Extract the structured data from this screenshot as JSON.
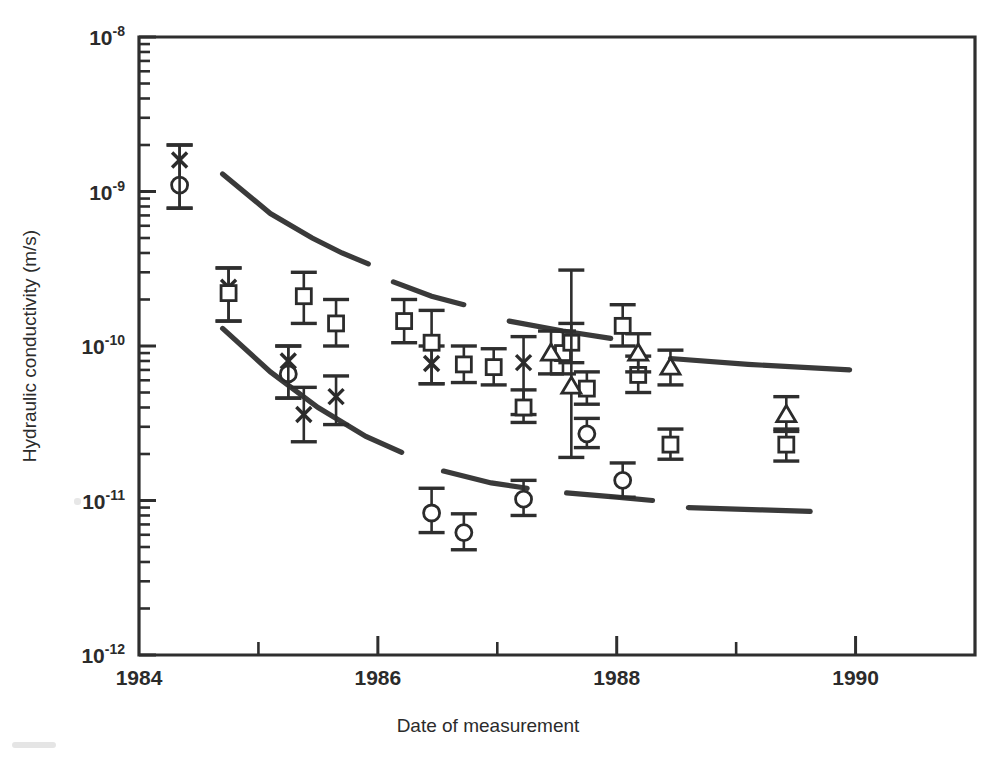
{
  "chart_data": {
    "type": "scatter",
    "title": "",
    "xlabel": "Date of measurement",
    "ylabel": "Hydraulic conductivity (m/s)",
    "xlim": [
      1984,
      1991
    ],
    "ylim": [
      1e-12,
      1e-08
    ],
    "yscale": "log",
    "xscale": "linear",
    "grid": false,
    "legend": "none",
    "x_tick_labels": [
      "1984",
      "1986",
      "1988",
      "1990"
    ],
    "x_tick_values": [
      1984,
      1986,
      1988,
      1990
    ],
    "x_minor_tick_values": [
      1985,
      1987,
      1989,
      1991
    ],
    "y_tick_labels": [
      "10-12",
      "10-11",
      "10-10",
      "10-9",
      "10-8"
    ],
    "y_tick_mantissas": [
      "10",
      "10",
      "10",
      "10",
      "10"
    ],
    "y_tick_exponents": [
      "-12",
      "-11",
      "-10",
      "-9",
      "-8"
    ],
    "y_tick_values": [
      1e-12,
      1e-11,
      1e-10,
      1e-09,
      1e-08
    ],
    "series": [
      {
        "name": "circle-series",
        "marker": "circle",
        "points": [
          {
            "x": 1984.34,
            "y": 1.1e-09,
            "yerr_low": 7.8e-10,
            "yerr_high": 2e-09
          },
          {
            "x": 1985.25,
            "y": 6.6e-11,
            "yerr_low": 4.6e-11,
            "yerr_high": 1e-10
          },
          {
            "x": 1986.45,
            "y": 8.3e-12,
            "yerr_low": 6.2e-12,
            "yerr_high": 1.2e-11
          },
          {
            "x": 1986.72,
            "y": 6.2e-12,
            "yerr_low": 4.8e-12,
            "yerr_high": 8.2e-12
          },
          {
            "x": 1987.22,
            "y": 1.02e-11,
            "yerr_low": 8e-12,
            "yerr_high": 1.35e-11
          },
          {
            "x": 1987.75,
            "y": 2.7e-11,
            "yerr_low": 2.2e-11,
            "yerr_high": 3.4e-11
          },
          {
            "x": 1988.05,
            "y": 1.35e-11,
            "yerr_low": 1.05e-11,
            "yerr_high": 1.75e-11
          }
        ]
      },
      {
        "name": "cross-series",
        "marker": "cross",
        "points": [
          {
            "x": 1984.34,
            "y": 1.6e-09,
            "yerr_low": 7.8e-10,
            "yerr_high": 2e-09
          },
          {
            "x": 1984.75,
            "y": 2.4e-10,
            "yerr_low": 1.45e-10,
            "yerr_high": 3.2e-10
          },
          {
            "x": 1985.25,
            "y": 8e-11,
            "yerr_low": 4.6e-11,
            "yerr_high": 1e-10
          },
          {
            "x": 1985.38,
            "y": 3.6e-11,
            "yerr_low": 2.4e-11,
            "yerr_high": 5.4e-11
          },
          {
            "x": 1985.65,
            "y": 4.7e-11,
            "yerr_low": 3.1e-11,
            "yerr_high": 6.4e-11
          },
          {
            "x": 1986.45,
            "y": 7.7e-11,
            "yerr_low": 5.7e-11,
            "yerr_high": 1e-10
          },
          {
            "x": 1987.22,
            "y": 7.8e-11,
            "yerr_low": 3.6e-11,
            "yerr_high": 1.15e-10
          }
        ]
      },
      {
        "name": "square-series",
        "marker": "square",
        "points": [
          {
            "x": 1984.75,
            "y": 2.2e-10,
            "yerr_low": 1.45e-10,
            "yerr_high": 3.2e-10
          },
          {
            "x": 1985.38,
            "y": 2.1e-10,
            "yerr_low": 1.4e-10,
            "yerr_high": 3e-10
          },
          {
            "x": 1985.65,
            "y": 1.4e-10,
            "yerr_low": 1e-10,
            "yerr_high": 2e-10
          },
          {
            "x": 1986.22,
            "y": 1.45e-10,
            "yerr_low": 1.05e-10,
            "yerr_high": 2e-10
          },
          {
            "x": 1986.45,
            "y": 1.05e-10,
            "yerr_low": 5.7e-11,
            "yerr_high": 1.7e-10
          },
          {
            "x": 1986.72,
            "y": 7.6e-11,
            "yerr_low": 5.8e-11,
            "yerr_high": 1e-10
          },
          {
            "x": 1986.97,
            "y": 7.3e-11,
            "yerr_low": 5.6e-11,
            "yerr_high": 9.6e-11
          },
          {
            "x": 1987.22,
            "y": 4e-11,
            "yerr_low": 3.2e-11,
            "yerr_high": 5.2e-11
          },
          {
            "x": 1987.55,
            "y": 9e-11,
            "yerr_low": 6.6e-11,
            "yerr_high": 1.25e-10
          },
          {
            "x": 1987.62,
            "y": 1.05e-10,
            "yerr_low": 7.8e-11,
            "yerr_high": 1.4e-10
          },
          {
            "x": 1987.75,
            "y": 5.3e-11,
            "yerr_low": 4.2e-11,
            "yerr_high": 6.8e-11
          },
          {
            "x": 1988.05,
            "y": 1.35e-10,
            "yerr_low": 1e-10,
            "yerr_high": 1.85e-10
          },
          {
            "x": 1988.18,
            "y": 6.5e-11,
            "yerr_low": 5e-11,
            "yerr_high": 8.6e-11
          },
          {
            "x": 1988.45,
            "y": 2.3e-11,
            "yerr_low": 1.85e-11,
            "yerr_high": 2.9e-11
          },
          {
            "x": 1989.42,
            "y": 2.3e-11,
            "yerr_low": 1.8e-11,
            "yerr_high": 2.9e-11
          }
        ]
      },
      {
        "name": "triangle-series",
        "marker": "triangle",
        "points": [
          {
            "x": 1987.45,
            "y": 9e-11,
            "yerr_low": 6.6e-11,
            "yerr_high": 1.25e-10
          },
          {
            "x": 1987.62,
            "y": 5.5e-11,
            "yerr_low": 1.9e-11,
            "yerr_high": 3.1e-10
          },
          {
            "x": 1988.18,
            "y": 9e-11,
            "yerr_low": 6.8e-11,
            "yerr_high": 1.2e-10
          },
          {
            "x": 1988.45,
            "y": 7.3e-11,
            "yerr_low": 5.6e-11,
            "yerr_high": 9.4e-11
          },
          {
            "x": 1989.42,
            "y": 3.6e-11,
            "yerr_low": 2.8e-11,
            "yerr_high": 4.7e-11
          }
        ]
      }
    ],
    "trend_curves": [
      {
        "name": "upper-bound-curve",
        "style": "thick-dashed",
        "segments": [
          [
            [
              1984.7,
              1.3e-09
            ],
            [
              1985.1,
              7.2e-10
            ],
            [
              1985.45,
              5e-10
            ],
            [
              1985.7,
              4e-10
            ],
            [
              1985.92,
              3.4e-10
            ]
          ],
          [
            [
              1986.13,
              2.6e-10
            ],
            [
              1986.45,
              2.1e-10
            ],
            [
              1986.72,
              1.85e-10
            ]
          ],
          [
            [
              1987.1,
              1.45e-10
            ],
            [
              1987.55,
              1.25e-10
            ],
            [
              1987.95,
              1.12e-10
            ]
          ],
          [
            [
              1988.45,
              8.3e-11
            ],
            [
              1989.1,
              7.6e-11
            ],
            [
              1989.95,
              7e-11
            ]
          ]
        ]
      },
      {
        "name": "lower-bound-curve",
        "style": "thick-dashed",
        "segments": [
          [
            [
              1984.7,
              1.3e-10
            ],
            [
              1985.1,
              6.8e-11
            ],
            [
              1985.5,
              4e-11
            ],
            [
              1985.9,
              2.6e-11
            ],
            [
              1986.2,
              2.05e-11
            ]
          ],
          [
            [
              1986.55,
              1.55e-11
            ],
            [
              1986.95,
              1.3e-11
            ],
            [
              1987.25,
              1.2e-11
            ]
          ],
          [
            [
              1987.58,
              1.12e-11
            ],
            [
              1988.0,
              1.05e-11
            ],
            [
              1988.3,
              1e-11
            ]
          ],
          [
            [
              1988.6,
              9e-12
            ],
            [
              1989.2,
              8.7e-12
            ],
            [
              1989.62,
              8.5e-12
            ]
          ]
        ]
      }
    ]
  }
}
